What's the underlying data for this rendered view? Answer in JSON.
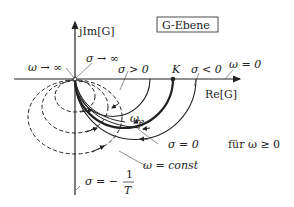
{
  "diagram": {
    "title_box": "G-Ebene",
    "axes": {
      "imag_label": "jIm[G]",
      "real_label": "Re[G]"
    },
    "labels": {
      "omega_inf": "ω → ∞",
      "sigma_inf": "σ → ∞",
      "sigma_pos": "σ > 0",
      "K": "K",
      "sigma_neg": "σ < 0",
      "omega_zero": "ω = 0",
      "omega_e": "ω",
      "omega_e_sub": "e",
      "sigma_zero": "σ = 0",
      "for_omega": "für ω ≥ 0",
      "omega_const": "ω = const",
      "sigma_minus": "σ = −",
      "frac_num": "1",
      "frac_den": "T"
    },
    "curves": {
      "solid_semicircles": [
        {
          "name": "sigma-positive",
          "re_intercept_px": 150
        },
        {
          "name": "sigma-zero-K",
          "re_intercept_px": 173,
          "thick": true
        },
        {
          "name": "sigma-negative",
          "re_intercept_px": 196
        }
      ],
      "dashed_circles": [
        {
          "name": "omega-const-1",
          "bottom_px": 110
        },
        {
          "name": "omega-const-2",
          "bottom_px": 130
        },
        {
          "name": "omega-const-3",
          "bottom_px": 152
        }
      ]
    },
    "colors": {
      "line": "#222222",
      "background": "#ffffff"
    }
  }
}
